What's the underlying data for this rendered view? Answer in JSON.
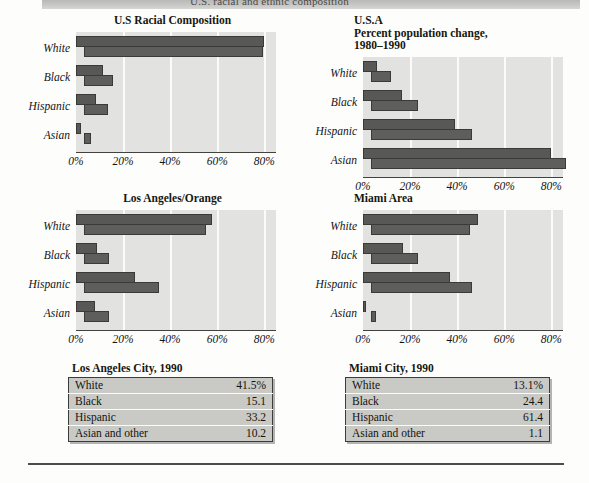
{
  "header": {
    "title": "U.S. racial and ethnic composition"
  },
  "axis": {
    "ticks": [
      "0%",
      "20%",
      "40%",
      "60%",
      "80%"
    ],
    "tick_values": [
      0,
      20,
      40,
      60,
      80
    ],
    "max": 85
  },
  "categories": [
    "White",
    "Black",
    "Hispanic",
    "Asian"
  ],
  "panels": [
    {
      "id": "us-racial-composition",
      "title": "U.S Racial Composition"
    },
    {
      "id": "usa-percent-population-change",
      "title": "U.S.A\nPercent population change,\n1980–1990"
    },
    {
      "id": "los-angeles-orange",
      "title": "Los Angeles/Orange"
    },
    {
      "id": "miami-area",
      "title": "Miami Area"
    }
  ],
  "tables": [
    {
      "id": "los-angeles-city-1990",
      "caption": "Los Angeles City, 1990",
      "rows": [
        {
          "label": "White",
          "value": "41.5%"
        },
        {
          "label": "Black",
          "value": "15.1"
        },
        {
          "label": "Hispanic",
          "value": "33.2"
        },
        {
          "label": "Asian and other",
          "value": "10.2"
        }
      ]
    },
    {
      "id": "miami-city-1990",
      "caption": "Miami City, 1990",
      "rows": [
        {
          "label": "White",
          "value": "13.1%"
        },
        {
          "label": "Black",
          "value": "24.4"
        },
        {
          "label": "Hispanic",
          "value": "61.4"
        },
        {
          "label": "Asian and other",
          "value": "1.1"
        }
      ]
    }
  ],
  "chart_data": [
    {
      "type": "bar",
      "orientation": "horizontal",
      "title": "U.S Racial Composition",
      "xlabel": "",
      "ylabel": "",
      "categories": [
        "White",
        "Black",
        "Hispanic",
        "Asian"
      ],
      "xlim": [
        0,
        85
      ],
      "xticks": [
        0,
        20,
        40,
        60,
        80
      ],
      "xticklabels": [
        "0%",
        "20%",
        "40%",
        "60%",
        "80%"
      ],
      "grid": true,
      "legend": "none",
      "series": [
        {
          "name": "upper",
          "values": [
            80.0,
            11.5,
            8.5,
            2.0
          ]
        },
        {
          "name": "lower",
          "values": [
            76.0,
            12.5,
            10.0,
            3.0
          ]
        }
      ]
    },
    {
      "type": "bar",
      "orientation": "horizontal",
      "title": "U.S.A Percent population change, 1980-1990",
      "xlabel": "",
      "ylabel": "",
      "categories": [
        "White",
        "Black",
        "Hispanic",
        "Asian"
      ],
      "xlim": [
        0,
        85
      ],
      "xticks": [
        0,
        20,
        40,
        60,
        80
      ],
      "xticklabels": [
        "0%",
        "20%",
        "40%",
        "60%",
        "80%"
      ],
      "grid": true,
      "legend": "none",
      "series": [
        {
          "name": "upper",
          "values": [
            6.0,
            16.5,
            39.0,
            80.0
          ]
        },
        {
          "name": "lower",
          "values": [
            8.5,
            20.0,
            43.0,
            83.0
          ]
        }
      ]
    },
    {
      "type": "bar",
      "orientation": "horizontal",
      "title": "Los Angeles/Orange",
      "xlabel": "",
      "ylabel": "",
      "categories": [
        "White",
        "Black",
        "Hispanic",
        "Asian"
      ],
      "xlim": [
        0,
        85
      ],
      "xticks": [
        0,
        20,
        40,
        60,
        80
      ],
      "xticklabels": [
        "0%",
        "20%",
        "40%",
        "60%",
        "80%"
      ],
      "grid": true,
      "legend": "none",
      "series": [
        {
          "name": "upper",
          "values": [
            58.0,
            9.0,
            25.0,
            8.0
          ]
        },
        {
          "name": "lower",
          "values": [
            52.0,
            10.5,
            32.0,
            10.5
          ]
        }
      ]
    },
    {
      "type": "bar",
      "orientation": "horizontal",
      "title": "Miami Area",
      "xlabel": "",
      "ylabel": "",
      "categories": [
        "White",
        "Black",
        "Hispanic",
        "Asian"
      ],
      "xlim": [
        0,
        85
      ],
      "xticks": [
        0,
        20,
        40,
        60,
        80
      ],
      "xticklabels": [
        "0%",
        "20%",
        "40%",
        "60%",
        "80%"
      ],
      "grid": true,
      "legend": "none",
      "series": [
        {
          "name": "upper",
          "values": [
            49.0,
            17.0,
            37.0,
            1.0
          ]
        },
        {
          "name": "lower",
          "values": [
            42.0,
            20.0,
            43.0,
            2.0
          ]
        }
      ]
    }
  ]
}
